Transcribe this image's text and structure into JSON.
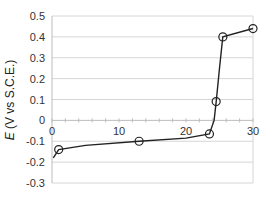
{
  "chart_data": {
    "type": "line",
    "title": "",
    "xlabel": "",
    "ylabel_italic": "E",
    "ylabel_rest": " (V vs S.C.E.)",
    "ylabel": "E (V vs S.C.E.)",
    "xlim": [
      0,
      30
    ],
    "ylim": [
      -0.3,
      0.5
    ],
    "x_ticks": [
      "0",
      "10",
      "20",
      "30"
    ],
    "y_ticks": [
      "0.5",
      "0.4",
      "0.3",
      "0.2",
      "0.1",
      "0",
      "-0.1",
      "-0.2",
      "-0.3"
    ],
    "grid": true,
    "legend": null,
    "series": [
      {
        "name": "E curve",
        "color": "#222222",
        "line_points": [
          [
            0.2,
            -0.18
          ],
          [
            1,
            -0.14
          ],
          [
            5,
            -0.12
          ],
          [
            13,
            -0.1
          ],
          [
            20,
            -0.085
          ],
          [
            23.5,
            -0.065
          ],
          [
            24.2,
            0.0
          ],
          [
            24.5,
            0.09
          ],
          [
            25.0,
            0.25
          ],
          [
            25.5,
            0.4
          ],
          [
            30,
            0.44
          ]
        ],
        "markers": [
          [
            1,
            -0.14
          ],
          [
            13,
            -0.1
          ],
          [
            23.5,
            -0.065
          ],
          [
            24.5,
            0.09
          ],
          [
            25.5,
            0.4
          ],
          [
            30,
            0.44
          ]
        ]
      }
    ]
  }
}
